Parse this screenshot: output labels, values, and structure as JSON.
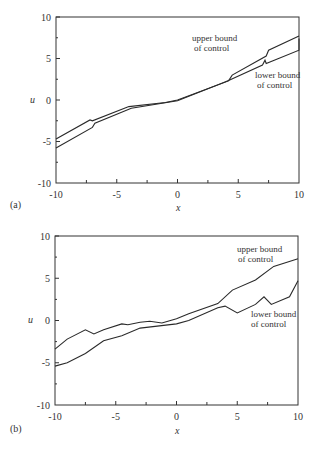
{
  "chart_data": [
    {
      "type": "line",
      "panel_label": "(a)",
      "title": "",
      "xlabel": "x",
      "ylabel": "u",
      "xlim": [
        -10,
        10
      ],
      "ylim": [
        -10,
        10
      ],
      "xticks": [
        -10,
        -5,
        0,
        5,
        10
      ],
      "yticks": [
        -10,
        -5,
        0,
        5,
        10
      ],
      "grid": false,
      "annotations": [
        {
          "text_line1": "upper bound",
          "text_line2": "of control",
          "x": 3.7,
          "y": 7.2
        },
        {
          "text_line1": "lower bound",
          "text_line2": "of control",
          "x": 6.2,
          "y": 3.3
        }
      ],
      "series": [
        {
          "name": "upper bound of control",
          "x": [
            -10,
            -7.2,
            -7.0,
            -4.0,
            -1.0,
            0.0,
            4.2,
            4.5,
            7.3,
            7.5,
            10.0
          ],
          "y": [
            -4.7,
            -2.4,
            -2.5,
            -0.8,
            -0.3,
            0.0,
            2.3,
            3.0,
            5.3,
            6.0,
            7.7
          ]
        },
        {
          "name": "lower bound of control",
          "x": [
            -10,
            -7.0,
            -6.8,
            -3.8,
            0.0,
            3.8,
            4.3,
            7.0,
            7.2,
            7.3,
            10.0,
            10.0
          ],
          "y": [
            -5.8,
            -3.3,
            -2.8,
            -1.0,
            -0.1,
            2.1,
            2.4,
            4.2,
            4.8,
            4.4,
            6.0,
            7.4
          ]
        }
      ]
    },
    {
      "type": "line",
      "panel_label": "(b)",
      "title": "",
      "xlabel": "x",
      "ylabel": "u",
      "xlim": [
        -10,
        10
      ],
      "ylim": [
        -10,
        10
      ],
      "xticks": [
        -10,
        -5,
        0,
        5,
        10
      ],
      "yticks": [
        -10,
        -5,
        0,
        5,
        10
      ],
      "grid": false,
      "annotations": [
        {
          "text_line1": "upper bound",
          "text_line2": "of control",
          "x": 4.0,
          "y": 8.2
        },
        {
          "text_line1": "lower bound",
          "text_line2": "of control",
          "x": 5.3,
          "y": 0.0
        }
      ],
      "series": [
        {
          "name": "upper bound of control",
          "x": [
            -10,
            -9.0,
            -7.5,
            -6.8,
            -6.0,
            -4.5,
            -4.0,
            -3.0,
            -2.2,
            -1.2,
            0.0,
            1.0,
            3.4,
            4.6,
            6.5,
            8.0,
            10.0
          ],
          "y": [
            -3.4,
            -2.2,
            -1.1,
            -1.6,
            -1.1,
            -0.4,
            -0.5,
            -0.2,
            -0.1,
            -0.3,
            0.2,
            0.8,
            2.0,
            3.6,
            4.8,
            6.4,
            7.3
          ]
        },
        {
          "name": "lower bound of control",
          "x": [
            -10,
            -9.0,
            -7.5,
            -6.0,
            -4.5,
            -3.0,
            0.0,
            1.0,
            3.4,
            4.0,
            5.0,
            6.5,
            7.2,
            7.8,
            9.3,
            10.0
          ],
          "y": [
            -5.4,
            -5.0,
            -3.9,
            -2.4,
            -1.8,
            -0.9,
            -0.4,
            0.0,
            1.5,
            1.7,
            0.9,
            1.9,
            2.8,
            1.9,
            2.8,
            4.7
          ]
        }
      ]
    }
  ],
  "panels": [
    {
      "label": "(a)",
      "xlabel": "x",
      "ylabel": "u",
      "xtick_labels": [
        "-10",
        "-5",
        "0",
        "5",
        "10"
      ],
      "ytick_labels": [
        "10",
        "5",
        "0",
        "-5",
        "-10"
      ],
      "upper_annot_1": "upper bound",
      "upper_annot_2": "of control",
      "lower_annot_1": "lower bound",
      "lower_annot_2": "of control"
    },
    {
      "label": "(b)",
      "xlabel": "x",
      "ylabel": "u",
      "xtick_labels": [
        "-10",
        "-5",
        "0",
        "5",
        "10"
      ],
      "ytick_labels": [
        "10",
        "5",
        "0",
        "-5",
        "-10"
      ],
      "upper_annot_1": "upper bound",
      "upper_annot_2": "of control",
      "lower_annot_1": "lower bound",
      "lower_annot_2": "of control"
    }
  ],
  "colors": {
    "line": "#2a2a2a",
    "axis": "#333333",
    "background": "#ffffff"
  }
}
